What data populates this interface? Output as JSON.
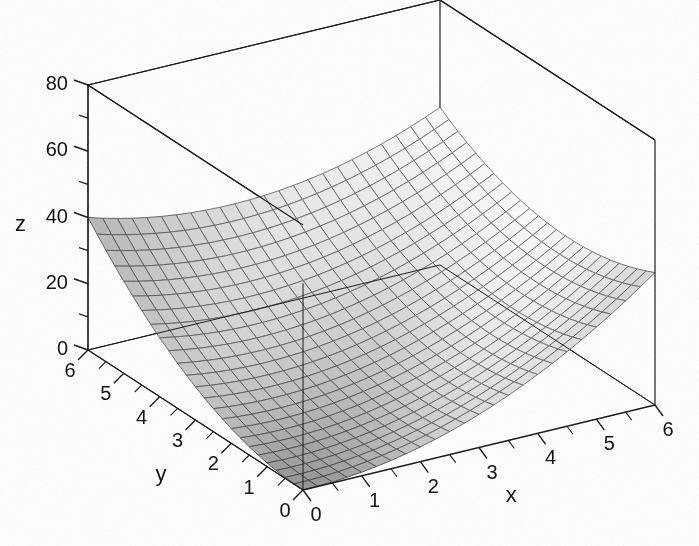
{
  "figure": {
    "kind": "3d-surface-plot",
    "background_color": "#fdfdfc",
    "line_color": "#1a1a1a",
    "mesh_color": "#555555",
    "width": 699,
    "height": 546
  },
  "axes": {
    "x": {
      "label": "x",
      "min": 0,
      "max": 6,
      "ticks": [
        0,
        1,
        2,
        3,
        4,
        5,
        6
      ],
      "tick_labels": [
        "0",
        "1",
        "2",
        "3",
        "4",
        "5",
        "6"
      ],
      "minor_ticks_between": 1
    },
    "y": {
      "label": "y",
      "min": 0,
      "max": 6,
      "ticks": [
        0,
        1,
        2,
        3,
        4,
        5,
        6
      ],
      "tick_labels": [
        "0",
        "1",
        "2",
        "3",
        "4",
        "5",
        "6"
      ],
      "minor_ticks_between": 1
    },
    "z": {
      "label": "z",
      "min": 0,
      "max": 80,
      "ticks": [
        0,
        20,
        40,
        60,
        80
      ],
      "tick_labels": [
        "0",
        "20",
        "40",
        "60",
        "80"
      ],
      "minor_ticks": [
        10,
        30,
        50,
        70
      ]
    }
  },
  "chart_data": {
    "type": "surface",
    "title": "",
    "xlabel": "x",
    "ylabel": "y",
    "zlabel": "z",
    "xlim": [
      0,
      6
    ],
    "ylim": [
      0,
      6
    ],
    "zlim": [
      0,
      80
    ],
    "grid": false,
    "legend": "none",
    "colormap": "grayscale",
    "mesh_divisions": {
      "x": 24,
      "y": 24
    },
    "surface_equation": "z = 1.111 * (x^2 + y^2) - 0.9 * x * y",
    "corner_values": [
      {
        "x": 0,
        "y": 0,
        "z": 0
      },
      {
        "x": 6,
        "y": 0,
        "z": 40
      },
      {
        "x": 0,
        "y": 6,
        "z": 40
      },
      {
        "x": 6,
        "y": 6,
        "z": 80
      }
    ],
    "x": [
      0,
      0.5,
      1,
      1.5,
      2,
      2.5,
      3,
      3.5,
      4,
      4.5,
      5,
      5.5,
      6
    ],
    "y": [
      0,
      0.5,
      1,
      1.5,
      2,
      2.5,
      3,
      3.5,
      4,
      4.5,
      5,
      5.5,
      6
    ],
    "z": [
      [
        0.0,
        0.3,
        1.1,
        2.5,
        4.4,
        6.9,
        10.0,
        13.6,
        17.8,
        22.5,
        27.8,
        33.6,
        40.0
      ],
      [
        0.3,
        0.4,
        1.0,
        2.1,
        3.8,
        6.1,
        8.9,
        12.3,
        16.2,
        20.7,
        25.7,
        31.3,
        37.5
      ],
      [
        1.1,
        1.0,
        1.4,
        2.3,
        3.7,
        5.7,
        8.3,
        11.4,
        15.1,
        19.4,
        24.2,
        29.5,
        35.4
      ],
      [
        2.5,
        2.1,
        2.3,
        3.0,
        4.2,
        5.9,
        8.3,
        11.1,
        14.6,
        18.6,
        23.2,
        28.3,
        33.9
      ],
      [
        4.4,
        3.8,
        3.7,
        4.2,
        5.2,
        6.7,
        8.8,
        11.4,
        14.6,
        18.4,
        22.7,
        27.5,
        32.9
      ],
      [
        6.9,
        6.1,
        5.7,
        5.9,
        6.7,
        8.0,
        9.8,
        12.2,
        15.2,
        18.7,
        22.7,
        27.3,
        32.5
      ],
      [
        10.0,
        8.9,
        8.3,
        8.3,
        8.8,
        9.8,
        11.4,
        13.6,
        16.3,
        19.5,
        23.3,
        27.6,
        32.5
      ],
      [
        13.6,
        12.3,
        11.4,
        11.1,
        11.4,
        12.2,
        13.6,
        15.5,
        17.9,
        20.9,
        24.4,
        28.5,
        33.1
      ],
      [
        17.8,
        16.2,
        15.1,
        14.6,
        14.6,
        15.2,
        16.3,
        17.9,
        20.1,
        22.8,
        26.1,
        29.9,
        34.2
      ],
      [
        22.5,
        20.7,
        19.4,
        18.6,
        18.4,
        18.7,
        19.5,
        20.9,
        22.8,
        25.3,
        28.3,
        31.9,
        35.9
      ],
      [
        27.8,
        25.7,
        24.2,
        23.2,
        22.7,
        22.7,
        23.3,
        24.4,
        26.1,
        28.3,
        31.1,
        34.4,
        38.2
      ],
      [
        33.6,
        31.3,
        29.5,
        28.3,
        27.5,
        27.3,
        27.6,
        28.5,
        29.9,
        31.9,
        34.4,
        37.4,
        41.0
      ],
      [
        40.0,
        37.5,
        35.4,
        33.9,
        32.9,
        32.5,
        32.5,
        33.1,
        34.2,
        35.9,
        38.2,
        41.0,
        44.3
      ]
    ]
  },
  "projection": {
    "origin_px": {
      "x": 303,
      "y": 490
    },
    "x_axis_end_px": {
      "x": 655,
      "y": 405
    },
    "y_axis_end_px": {
      "x": 88,
      "y": 350
    },
    "z_top_px": {
      "x": 88,
      "y": 85
    },
    "z_height_px": 265
  }
}
